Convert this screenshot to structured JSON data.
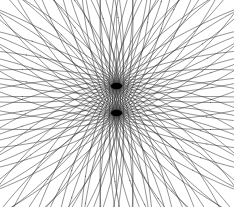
{
  "figure": {
    "type": "line-art-geometric",
    "canvas": {
      "width": 234,
      "height": 207,
      "background_color": "#ffffff"
    },
    "stroke": {
      "color": "#2a2a2a",
      "width": 0.55,
      "opacity": 0.92,
      "linecap": "round"
    },
    "nodes": {
      "upper": {
        "x": 116.5,
        "y": 86.0,
        "label": "upper-convergence-node"
      },
      "lower": {
        "x": 116.5,
        "y": 113.0,
        "label": "lower-convergence-node"
      },
      "node_color": "#000000",
      "node_radius": 4.2
    },
    "envelope": {
      "center_x": 116.5,
      "center_y": 100.0,
      "half_width": 105.0,
      "half_height": 94.0,
      "left_x": 11.5,
      "right_x": 221.5,
      "top_y": 6.0,
      "bottom_y": 194.0
    },
    "families": [
      {
        "name": "upper-family",
        "anchor": "upper",
        "ellipse_semi_major": 94.0,
        "ellipse_semi_minor": 16.5,
        "count": 40,
        "start_angle_deg": 0,
        "sweep_deg": 360,
        "direction": "outward-from-anchor"
      },
      {
        "name": "lower-family",
        "anchor": "lower",
        "ellipse_semi_major": 94.0,
        "ellipse_semi_minor": 16.5,
        "count": 40,
        "start_angle_deg": 0,
        "sweep_deg": 360,
        "direction": "outward-from-anchor"
      }
    ],
    "axis_line": {
      "enabled": true,
      "x": 116.5,
      "y1": 6.0,
      "y2": 196.0,
      "color": "#555555",
      "width": 0.5
    }
  }
}
